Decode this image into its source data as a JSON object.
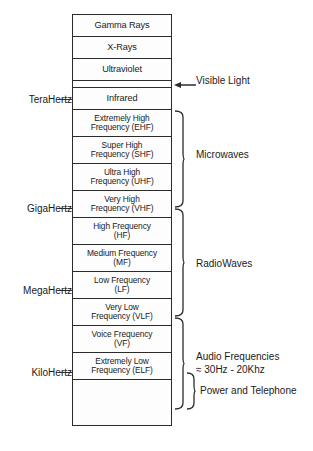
{
  "diagram": {
    "bands": [
      {
        "name": "gamma-rays",
        "line1": "Gamma Rays",
        "line2": "",
        "style": "single"
      },
      {
        "name": "x-rays",
        "line1": "X-Rays",
        "line2": "",
        "style": "single"
      },
      {
        "name": "ultraviolet",
        "line1": "Ultraviolet",
        "line2": "",
        "style": "single"
      },
      {
        "name": "visible-light",
        "line1": "",
        "line2": "",
        "style": "visible"
      },
      {
        "name": "infrared",
        "line1": "Infrared",
        "line2": "",
        "style": "single"
      },
      {
        "name": "ehf",
        "line1": "Extremely High",
        "line2": "Frequency (EHF)",
        "style": "double"
      },
      {
        "name": "shf",
        "line1": "Super High",
        "line2": "Frequency (SHF)",
        "style": "double"
      },
      {
        "name": "uhf",
        "line1": "Ultra High",
        "line2": "Frequency (UHF)",
        "style": "double"
      },
      {
        "name": "vhf",
        "line1": "Very High",
        "line2": "Frequency (VHF)",
        "style": "double"
      },
      {
        "name": "hf",
        "line1": "High Frequency",
        "line2": "(HF)",
        "style": "double"
      },
      {
        "name": "mf",
        "line1": "Medium Frequency",
        "line2": "(MF)",
        "style": "double"
      },
      {
        "name": "lf",
        "line1": "Low Frequency",
        "line2": "(LF)",
        "style": "double"
      },
      {
        "name": "vlf",
        "line1": "Very Low",
        "line2": "Frequency (VLF)",
        "style": "double"
      },
      {
        "name": "vf",
        "line1": "Voice Frequency",
        "line2": "(VF)",
        "style": "double"
      },
      {
        "name": "elf",
        "line1": "Extremely Low",
        "line2": "Frequency (ELF)",
        "style": "double"
      },
      {
        "name": "unlabeled-bottom",
        "line1": "",
        "line2": "",
        "style": "empty"
      }
    ],
    "axis_labels": [
      {
        "name": "terahertz",
        "text": "TeraHertz",
        "y": 99
      },
      {
        "name": "gigahertz",
        "text": "GigaHertz",
        "y": 208
      },
      {
        "name": "megahertz",
        "text": "MegaHertz",
        "y": 290
      },
      {
        "name": "kilohertz",
        "text": "KiloHertz",
        "y": 372
      }
    ],
    "callout": {
      "visible_light": "Visible Light",
      "visible_light_y": 80
    },
    "groups": [
      {
        "name": "microwaves",
        "line1": "Microwaves",
        "line2": "",
        "label_y": 154,
        "brace_top": 110,
        "brace_bottom": 208
      },
      {
        "name": "radiowaves",
        "line1": "RadioWaves",
        "line2": "",
        "label_y": 263,
        "brace_top": 208,
        "brace_bottom": 317
      },
      {
        "name": "audio-frequencies",
        "line1": "Audio Frequencies",
        "line2": "≈ 30Hz - 20Khz",
        "label_y": 363,
        "brace_top": 317,
        "brace_bottom": 410
      },
      {
        "name": "power-and-telephone",
        "line1": "Power and Telephone",
        "line2": "",
        "label_y": 390,
        "brace_top": 372,
        "brace_bottom": 410
      }
    ]
  }
}
